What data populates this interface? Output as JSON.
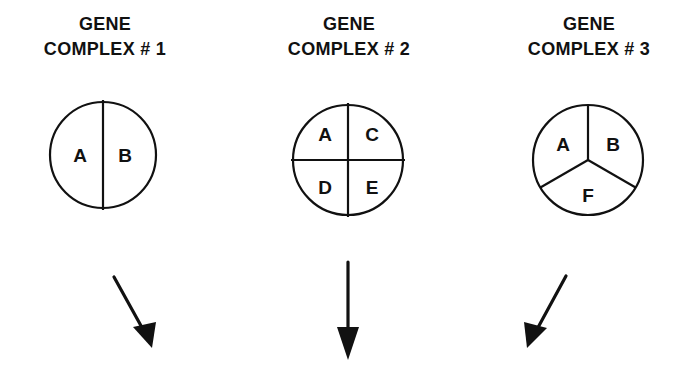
{
  "figure": {
    "background_color": "#ffffff",
    "ink_color": "#111111",
    "complexes": [
      {
        "id": "complex-1",
        "title_line1": "GENE",
        "title_line2": "COMPLEX  # 1",
        "title_truncated": false,
        "division": "halves",
        "sector_count": 2,
        "sectors": [
          {
            "label": "A",
            "position": "left"
          },
          {
            "label": "B",
            "position": "right"
          }
        ],
        "arrow": {
          "direction": "down-right",
          "label": ""
        }
      },
      {
        "id": "complex-2",
        "title_line1": "GENE",
        "title_line2": "COMPLEX # 2",
        "title_truncated": false,
        "division": "quadrants",
        "sector_count": 4,
        "sectors": [
          {
            "label": "A",
            "position": "top-left"
          },
          {
            "label": "C",
            "position": "top-right"
          },
          {
            "label": "D",
            "position": "bottom-left"
          },
          {
            "label": "E",
            "position": "bottom-right"
          }
        ],
        "arrow": {
          "direction": "down",
          "label": ""
        }
      },
      {
        "id": "complex-3",
        "title_line1": "GENE",
        "title_line2": "COMPLEX # 3",
        "title_truncated": true,
        "division": "thirds",
        "sector_count": 3,
        "sectors": [
          {
            "label": "A",
            "position": "upper-left"
          },
          {
            "label": "B",
            "position": "upper-right"
          },
          {
            "label": "F",
            "position": "bottom"
          }
        ],
        "arrow": {
          "direction": "down-left",
          "label": ""
        }
      }
    ]
  }
}
